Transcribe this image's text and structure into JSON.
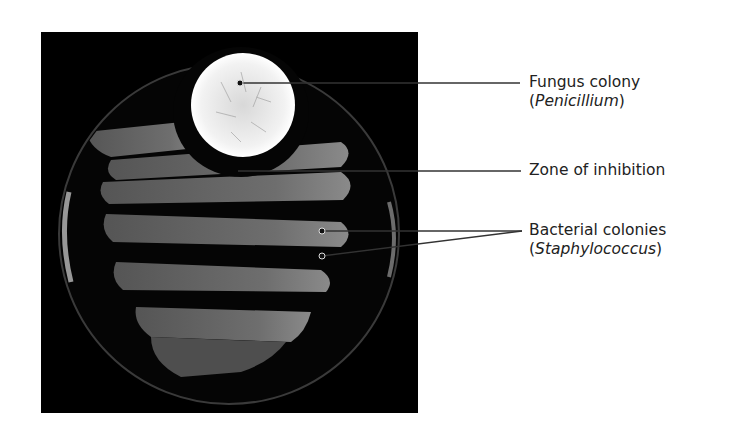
{
  "figure": {
    "type": "labeled photograph"
  },
  "labels": [
    {
      "id": "fungus",
      "line1": "Fungus colony",
      "line2_prefix": "(",
      "line2_italic": "Penicillium",
      "line2_suffix": ")"
    },
    {
      "id": "zone",
      "line1": "Zone of inhibition"
    },
    {
      "id": "bacteria",
      "line1": "Bacterial colonies",
      "line2_prefix": "(",
      "line2_italic": "Staphylococcus",
      "line2_suffix": ")"
    }
  ],
  "colors": {
    "photo_background": "#000000",
    "fungus": "#e8e8e8",
    "bacteria_streak": "#6a6a6a",
    "leader_line": "#333333",
    "text": "#222222"
  }
}
